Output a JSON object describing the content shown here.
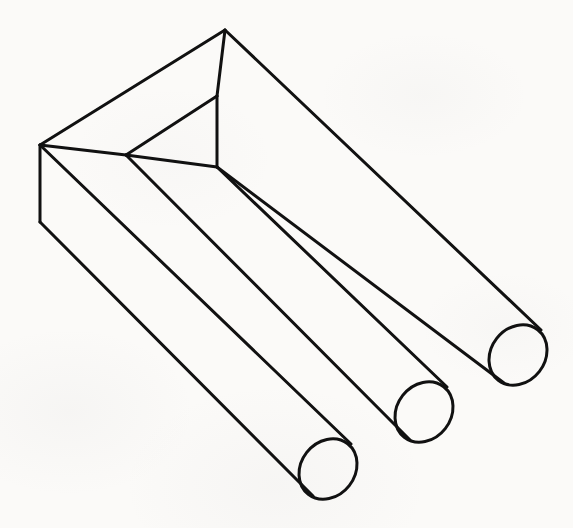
{
  "figure": {
    "title": "Impossible Trident",
    "alt_names": "Devil's fork / blivet / impossible fork",
    "type": "line drawing",
    "canvas": {
      "width": 573,
      "height": 528
    },
    "background_color": "#fbfaf8",
    "stroke_color": "#111111",
    "stroke_width": 3,
    "fill": "none",
    "prong_count": 3,
    "caption": ""
  },
  "geometry": {
    "block": {
      "name": "rectangular-block",
      "top_apex": [
        225,
        30
      ],
      "left_top_corner": [
        40,
        145
      ],
      "left_bottom_corner": [
        40,
        222
      ],
      "outer_top_edge": "M225,30 L40,145",
      "outer_left_edge": "M40,145 L40,222",
      "front_face_outline": "M40,145 L40,222 L330,497 L355,441 L40,145",
      "top_face_outline": "M225,30 L40,145 L126,155 L217,96 L225,30"
    },
    "notch": {
      "name": "inner-notch",
      "apex": [
        217,
        96
      ],
      "left_corner": [
        126,
        155
      ],
      "bottom_vertex": [
        217,
        167
      ],
      "inner_vertical_edge": "M217,96 L217,167"
    },
    "prongs": [
      {
        "name": "prong-left",
        "axis_start": [
          105,
          257
        ],
        "ellipse_center": [
          328,
          469
        ],
        "ellipse_rx": 27,
        "ellipse_ry": 32,
        "ellipse_rotation_deg": 38
      },
      {
        "name": "prong-middle",
        "axis_start": [
          196,
          183
        ],
        "ellipse_center": [
          424,
          412
        ],
        "ellipse_rx": 27,
        "ellipse_ry": 32,
        "ellipse_rotation_deg": 38
      },
      {
        "name": "prong-right",
        "axis_start": [
          260,
          128
        ],
        "ellipse_center": [
          518,
          355
        ],
        "ellipse_rx": 27,
        "ellipse_ry": 32,
        "ellipse_rotation_deg": 38
      }
    ],
    "long_edge_angle_deg": 43.5
  }
}
